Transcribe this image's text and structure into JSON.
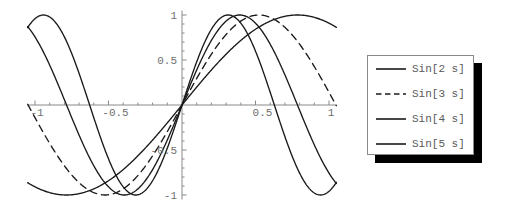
{
  "chart_data": {
    "type": "line",
    "title": "",
    "subtitle": "",
    "xlabel": "",
    "ylabel": "",
    "xlim": [
      -1.05,
      1.05
    ],
    "ylim": [
      -1.05,
      1.05
    ],
    "xticks": [
      -1,
      -0.5,
      0.5,
      1
    ],
    "xticklabels": [
      "-1",
      "-0.5",
      "0.5",
      "1"
    ],
    "yticks": [
      -1,
      -0.5,
      0.5,
      1
    ],
    "yticklabels": [
      "-1",
      "-0.5",
      "0.5",
      "1"
    ],
    "grid": false,
    "axes_style": "crosshair-through-origin",
    "minor_tick_interval": 0.1,
    "legend_position": "right",
    "series": [
      {
        "name": "Sin[2 s]",
        "frequency": 2,
        "linestyle": "solid",
        "color": "#1a1a1a",
        "formula": "sin(2*s)",
        "x": [
          -1.0,
          -0.9,
          -0.8,
          -0.7,
          -0.6,
          -0.5,
          -0.4,
          -0.3,
          -0.2,
          -0.1,
          0.0,
          0.1,
          0.2,
          0.3,
          0.4,
          0.5,
          0.6,
          0.7,
          0.8,
          0.9,
          1.0
        ],
        "values": [
          0.909,
          0.974,
          0.9996,
          0.985,
          0.932,
          0.841,
          0.717,
          0.565,
          0.389,
          0.199,
          0.0,
          -0.199,
          -0.389,
          -0.565,
          -0.717,
          -0.841,
          -0.932,
          -0.985,
          -0.9996,
          -0.974,
          -0.909
        ]
      },
      {
        "name": "Sin[3 s]",
        "frequency": 3,
        "linestyle": "dashed",
        "color": "#1a1a1a",
        "formula": "sin(3*s)",
        "x": [
          -1.0,
          -0.9,
          -0.8,
          -0.7,
          -0.6,
          -0.5,
          -0.4,
          -0.3,
          -0.2,
          -0.1,
          0.0,
          0.1,
          0.2,
          0.3,
          0.4,
          0.5,
          0.6,
          0.7,
          0.8,
          0.9,
          1.0
        ],
        "values": [
          0.141,
          0.427,
          0.675,
          0.863,
          0.974,
          0.997,
          0.932,
          0.783,
          0.565,
          0.296,
          0.0,
          -0.296,
          -0.565,
          -0.783,
          -0.932,
          -0.997,
          -0.974,
          -0.863,
          -0.675,
          -0.427,
          -0.141
        ]
      },
      {
        "name": "Sin[4 s]",
        "frequency": 4,
        "linestyle": "solid",
        "color": "#1a1a1a",
        "formula": "sin(4*s)",
        "x": [
          -1.0,
          -0.9,
          -0.8,
          -0.7,
          -0.6,
          -0.5,
          -0.4,
          -0.3,
          -0.2,
          -0.1,
          0.0,
          0.1,
          0.2,
          0.3,
          0.4,
          0.5,
          0.6,
          0.7,
          0.8,
          0.9,
          1.0
        ],
        "values": [
          -0.757,
          -0.443,
          -0.058,
          0.335,
          0.675,
          0.909,
          0.9996,
          0.932,
          0.717,
          0.389,
          0.0,
          -0.389,
          -0.717,
          -0.932,
          -0.9996,
          -0.909,
          -0.675,
          -0.335,
          0.058,
          0.443,
          0.757
        ]
      },
      {
        "name": "Sin[5 s]",
        "frequency": 5,
        "linestyle": "solid",
        "color": "#1a1a1a",
        "formula": "sin(5*s)",
        "x": [
          -1.0,
          -0.9,
          -0.8,
          -0.7,
          -0.6,
          -0.5,
          -0.4,
          -0.3,
          -0.2,
          -0.1,
          0.0,
          0.1,
          0.2,
          0.3,
          0.4,
          0.5,
          0.6,
          0.7,
          0.8,
          0.9,
          1.0
        ],
        "values": [
          0.959,
          0.978,
          0.757,
          0.351,
          -0.141,
          -0.598,
          -0.909,
          -0.997,
          -0.841,
          -0.479,
          0.0,
          0.479,
          0.841,
          0.997,
          0.909,
          0.598,
          0.141,
          -0.351,
          -0.757,
          -0.978,
          -0.959
        ]
      }
    ]
  },
  "legend": {
    "entries": [
      {
        "label": "Sin[2 s]",
        "style": "solid"
      },
      {
        "label": "Sin[3 s]",
        "style": "dashed"
      },
      {
        "label": "Sin[4 s]",
        "style": "solid"
      },
      {
        "label": "Sin[5 s]",
        "style": "solid"
      }
    ]
  },
  "axis_labels": {
    "x_neg_one": "-1",
    "x_neg_half": "-0.5",
    "x_pos_half": "0.5",
    "x_pos_one": "1",
    "y_pos_one": "1",
    "y_pos_half": "0.5",
    "y_neg_half": "-0.5",
    "y_neg_one": "-1"
  },
  "colors": {
    "curve": "#1a1a1a",
    "axis": "#8a8a8a",
    "tick_label": "#6f6f6f",
    "legend_border": "#8a8a8a",
    "legend_shadow": "#000000",
    "background": "#ffffff"
  }
}
